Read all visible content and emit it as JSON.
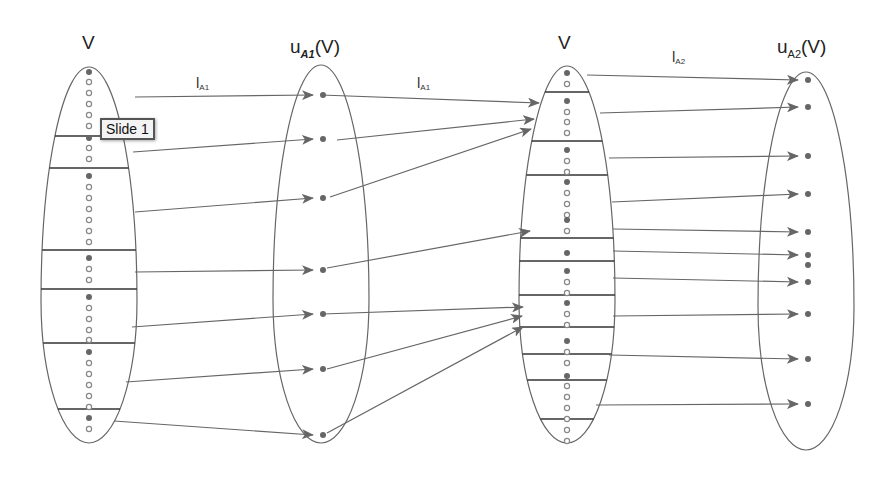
{
  "labels": {
    "set_v_left": "V",
    "set_ua1_base": "u",
    "set_ua1_sub": "A1",
    "set_ua1_tail": "(V)",
    "set_v_right": "V",
    "set_ua2_base": "u",
    "set_ua2_sub": "A2",
    "set_ua2_tail": "(V)",
    "map_1": {
      "base": "l",
      "sub": "A1"
    },
    "map_2": {
      "base": "l",
      "sub": "A1"
    },
    "map_3": {
      "base": "l",
      "sub": "A2"
    }
  },
  "tooltip": {
    "text": "Slide 1"
  },
  "colors": {
    "stroke": "#666666",
    "dot_filled": "#666666",
    "dot_hollow": "#888888",
    "divider": "#333333"
  },
  "ellipses": [
    {
      "id": "V-left",
      "cx": 89,
      "top": 67,
      "bottom": 443,
      "rx": 48
    },
    {
      "id": "uA1",
      "cx": 321,
      "top": 65,
      "bottom": 443,
      "rx": 48
    },
    {
      "id": "V-right",
      "cx": 567,
      "top": 66,
      "bottom": 443,
      "rx": 48
    },
    {
      "id": "uA2",
      "cx": 806,
      "top": 72,
      "bottom": 450,
      "rx": 48
    }
  ],
  "v_left": {
    "dividers_y": [
      136,
      168,
      250,
      289,
      343,
      409
    ],
    "dots": [
      {
        "y": 72,
        "f": 1
      },
      {
        "y": 82,
        "f": 0
      },
      {
        "y": 93,
        "f": 0
      },
      {
        "y": 104,
        "f": 0
      },
      {
        "y": 115,
        "f": 0
      },
      {
        "y": 126,
        "f": 0
      },
      {
        "y": 138,
        "f": 1
      },
      {
        "y": 148,
        "f": 0
      },
      {
        "y": 159,
        "f": 0
      },
      {
        "y": 176,
        "f": 1
      },
      {
        "y": 187,
        "f": 0
      },
      {
        "y": 198,
        "f": 0
      },
      {
        "y": 209,
        "f": 0
      },
      {
        "y": 220,
        "f": 0
      },
      {
        "y": 231,
        "f": 0
      },
      {
        "y": 242,
        "f": 0
      },
      {
        "y": 258,
        "f": 1
      },
      {
        "y": 269,
        "f": 0
      },
      {
        "y": 280,
        "f": 0
      },
      {
        "y": 297,
        "f": 1
      },
      {
        "y": 308,
        "f": 0
      },
      {
        "y": 319,
        "f": 0
      },
      {
        "y": 330,
        "f": 0
      },
      {
        "y": 340,
        "f": 0
      },
      {
        "y": 352,
        "f": 1
      },
      {
        "y": 363,
        "f": 0
      },
      {
        "y": 374,
        "f": 0
      },
      {
        "y": 385,
        "f": 0
      },
      {
        "y": 396,
        "f": 0
      },
      {
        "y": 407,
        "f": 0
      },
      {
        "y": 418,
        "f": 1
      },
      {
        "y": 429,
        "f": 0
      }
    ]
  },
  "ua1_dots_y": [
    95,
    139,
    198,
    270,
    314,
    369,
    435
  ],
  "v_right": {
    "dividers_y": [
      92,
      141,
      175,
      238,
      261,
      295,
      327,
      354,
      380,
      419
    ],
    "dots": [
      {
        "y": 73,
        "f": 1
      },
      {
        "y": 84,
        "f": 0
      },
      {
        "y": 101,
        "f": 1
      },
      {
        "y": 112,
        "f": 0
      },
      {
        "y": 122,
        "f": 0
      },
      {
        "y": 133,
        "f": 0
      },
      {
        "y": 150,
        "f": 1
      },
      {
        "y": 161,
        "f": 0
      },
      {
        "y": 172,
        "f": 0
      },
      {
        "y": 182,
        "f": 1
      },
      {
        "y": 193,
        "f": 0
      },
      {
        "y": 204,
        "f": 0
      },
      {
        "y": 215,
        "f": 0
      },
      {
        "y": 220,
        "f": 1
      },
      {
        "y": 231,
        "f": 0
      },
      {
        "y": 253,
        "f": 1
      },
      {
        "y": 271,
        "f": 1
      },
      {
        "y": 282,
        "f": 0
      },
      {
        "y": 293,
        "f": 0
      },
      {
        "y": 303,
        "f": 1
      },
      {
        "y": 314,
        "f": 0
      },
      {
        "y": 325,
        "f": 0
      },
      {
        "y": 341,
        "f": 1
      },
      {
        "y": 352,
        "f": 0
      },
      {
        "y": 363,
        "f": 0
      },
      {
        "y": 376,
        "f": 1
      },
      {
        "y": 386,
        "f": 0
      },
      {
        "y": 397,
        "f": 0
      },
      {
        "y": 408,
        "f": 0
      },
      {
        "y": 419,
        "f": 0
      },
      {
        "y": 430,
        "f": 0
      },
      {
        "y": 441,
        "f": 0
      }
    ]
  },
  "ua2_dots_y": [
    80,
    107,
    156,
    194,
    232,
    255,
    265,
    282,
    314,
    359,
    404
  ],
  "arrows_1": [
    {
      "x1": 135,
      "y1": 97,
      "x2": 313,
      "y2": 95
    },
    {
      "x1": 133,
      "y1": 152,
      "x2": 313,
      "y2": 139
    },
    {
      "x1": 135,
      "y1": 212,
      "x2": 313,
      "y2": 198
    },
    {
      "x1": 135,
      "y1": 272,
      "x2": 313,
      "y2": 270
    },
    {
      "x1": 132,
      "y1": 327,
      "x2": 313,
      "y2": 314
    },
    {
      "x1": 126,
      "y1": 382,
      "x2": 313,
      "y2": 369
    },
    {
      "x1": 114,
      "y1": 421,
      "x2": 313,
      "y2": 435
    }
  ],
  "arrows_2": [
    {
      "x1": 321,
      "y1": 95,
      "x2": 539,
      "y2": 103
    },
    {
      "x1": 337,
      "y1": 140,
      "x2": 534,
      "y2": 119
    },
    {
      "x1": 330,
      "y1": 197,
      "x2": 531,
      "y2": 129
    },
    {
      "x1": 327,
      "y1": 268,
      "x2": 530,
      "y2": 231
    },
    {
      "x1": 323,
      "y1": 314,
      "x2": 523,
      "y2": 307
    },
    {
      "x1": 327,
      "y1": 369,
      "x2": 522,
      "y2": 316
    },
    {
      "x1": 327,
      "y1": 433,
      "x2": 523,
      "y2": 327
    }
  ],
  "arrows_3": [
    {
      "x1": 587,
      "y1": 75,
      "x2": 798,
      "y2": 80
    },
    {
      "x1": 600,
      "y1": 113,
      "x2": 798,
      "y2": 107
    },
    {
      "x1": 609,
      "y1": 158,
      "x2": 798,
      "y2": 156
    },
    {
      "x1": 612,
      "y1": 202,
      "x2": 798,
      "y2": 194
    },
    {
      "x1": 613,
      "y1": 229,
      "x2": 798,
      "y2": 232
    },
    {
      "x1": 613,
      "y1": 251,
      "x2": 798,
      "y2": 255
    },
    {
      "x1": 613,
      "y1": 278,
      "x2": 798,
      "y2": 282
    },
    {
      "x1": 613,
      "y1": 316,
      "x2": 798,
      "y2": 314
    },
    {
      "x1": 609,
      "y1": 355,
      "x2": 798,
      "y2": 359
    },
    {
      "x1": 596,
      "y1": 405,
      "x2": 798,
      "y2": 404
    }
  ]
}
